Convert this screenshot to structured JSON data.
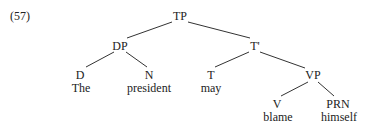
{
  "example_number": "(57)",
  "tree": {
    "root": "TP",
    "nodes": {
      "tp": {
        "label": "TP",
        "x": 180,
        "y": 10
      },
      "dp": {
        "label": "DP",
        "x": 120,
        "y": 39
      },
      "tbar": {
        "label": "T'",
        "x": 255,
        "y": 39
      },
      "d": {
        "label": "D",
        "x": 80,
        "y": 69
      },
      "n": {
        "label": "N",
        "x": 149,
        "y": 69
      },
      "t": {
        "label": "T",
        "x": 211,
        "y": 69
      },
      "vp": {
        "label": "VP",
        "x": 313,
        "y": 69
      },
      "v": {
        "label": "V",
        "x": 277,
        "y": 98
      },
      "prn": {
        "label": "PRN",
        "x": 338,
        "y": 98
      }
    },
    "words": {
      "the": "The",
      "president": "president",
      "may": "may",
      "blame": "blame",
      "himself": "himself"
    },
    "edges": [
      [
        "TP",
        "DP"
      ],
      [
        "TP",
        "T'"
      ],
      [
        "DP",
        "D"
      ],
      [
        "DP",
        "N"
      ],
      [
        "T'",
        "T"
      ],
      [
        "T'",
        "VP"
      ],
      [
        "VP",
        "V"
      ],
      [
        "VP",
        "PRN"
      ]
    ]
  }
}
